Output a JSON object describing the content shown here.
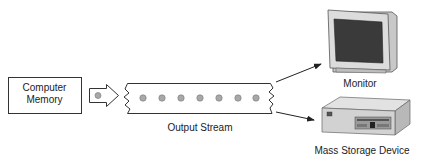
{
  "diagram": {
    "source": {
      "label_line1": "Computer",
      "label_line2": "Memory"
    },
    "stream": {
      "label": "Output Stream",
      "dot_count": 7
    },
    "destinations": [
      {
        "label": "Monitor",
        "icon": "monitor-icon"
      },
      {
        "label": "Mass Storage Device",
        "icon": "storage-device-icon"
      }
    ],
    "colors": {
      "stroke": "#333333",
      "dot_fill": "#a8a8a8",
      "monitor_body": "#d6d6d6",
      "monitor_screen": "#3a3a3a",
      "storage_body": "#d2d2d2"
    }
  }
}
